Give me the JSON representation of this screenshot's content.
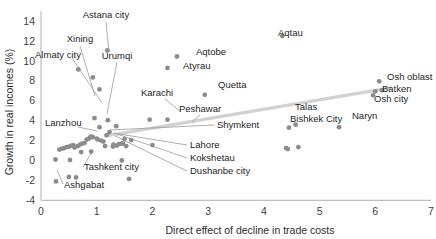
{
  "chart_data": {
    "type": "scatter",
    "title": "",
    "xlabel": "Direct effect of decline in trade costs",
    "ylabel": "Growth  in real incomes (%)",
    "xlim": [
      0,
      7
    ],
    "ylim": [
      -4,
      15
    ],
    "xticks": [
      "0",
      "1",
      "2",
      "3",
      "4",
      "5",
      "6",
      "7"
    ],
    "yticks": [
      "-4",
      "-2",
      "0",
      "2",
      "4",
      "6",
      "8",
      "10",
      "12",
      "14"
    ],
    "grid": false,
    "legend": "none",
    "trendline": {
      "x0": 1.15,
      "y0": 2.45,
      "x1": 6.27,
      "y1": 7.3
    },
    "labeled_points": [
      {
        "name": "Astana city",
        "x": 1.19,
        "y": 11.05
      },
      {
        "name": "Xining",
        "x": 0.67,
        "y": 9.15
      },
      {
        "name": "Almaty city",
        "x": 0.93,
        "y": 8.35
      },
      {
        "name": "Urumqi",
        "x": 1.05,
        "y": 7.15
      },
      {
        "name": "Aqtobe",
        "x": 2.44,
        "y": 10.45
      },
      {
        "name": "Atyrau",
        "x": 2.27,
        "y": 9.3
      },
      {
        "name": "Aqtau",
        "x": 4.33,
        "y": 12.5
      },
      {
        "name": "Quetta",
        "x": 2.94,
        "y": 6.6
      },
      {
        "name": "Karachi",
        "x": 1.95,
        "y": 4.1
      },
      {
        "name": "Peshawar",
        "x": 2.27,
        "y": 4.1
      },
      {
        "name": "Shymkent",
        "x": 1.18,
        "y": 2.55
      },
      {
        "name": "Lahore",
        "x": 1.47,
        "y": 1.7
      },
      {
        "name": "Kokshetau",
        "x": 1.36,
        "y": 1.5
      },
      {
        "name": "Dushanbe city",
        "x": 1.29,
        "y": 1.4
      },
      {
        "name": "Lanzhou",
        "x": 0.93,
        "y": 2.35
      },
      {
        "name": "Tashkent city",
        "x": 0.72,
        "y": 0.85
      },
      {
        "name": "Ashgabat",
        "x": 0.5,
        "y": -1.65
      },
      {
        "name": "Osh oblast",
        "x": 6.07,
        "y": 7.95
      },
      {
        "name": "Batken",
        "x": 6.12,
        "y": 7.05
      },
      {
        "name": "Osh city",
        "x": 5.96,
        "y": 6.55
      },
      {
        "name": "Talas",
        "x": 4.57,
        "y": 3.6
      },
      {
        "name": "Bishkek City",
        "x": 4.45,
        "y": 3.3
      },
      {
        "name": "Naryn",
        "x": 5.35,
        "y": 3.35
      }
    ],
    "unlabeled_points": [
      {
        "x": 0.26,
        "y": 0.1
      },
      {
        "x": 0.27,
        "y": -2.1
      },
      {
        "x": 0.33,
        "y": 1.1
      },
      {
        "x": 0.38,
        "y": 1.2
      },
      {
        "x": 0.42,
        "y": 1.25
      },
      {
        "x": 0.46,
        "y": 1.35
      },
      {
        "x": 0.5,
        "y": 1.4
      },
      {
        "x": 0.52,
        "y": 0.05
      },
      {
        "x": 0.55,
        "y": 1.5
      },
      {
        "x": 0.58,
        "y": 1.55
      },
      {
        "x": 0.6,
        "y": 1.3
      },
      {
        "x": 0.63,
        "y": -1.7
      },
      {
        "x": 0.66,
        "y": 1.45
      },
      {
        "x": 0.7,
        "y": 1.6
      },
      {
        "x": 0.74,
        "y": 1.7
      },
      {
        "x": 0.78,
        "y": 1.75
      },
      {
        "x": 0.82,
        "y": 2.1
      },
      {
        "x": 0.86,
        "y": 2.2
      },
      {
        "x": 0.88,
        "y": 2.3
      },
      {
        "x": 0.9,
        "y": 2.4
      },
      {
        "x": 0.96,
        "y": 4.25
      },
      {
        "x": 1.0,
        "y": 2.2
      },
      {
        "x": 1.02,
        "y": 2.1
      },
      {
        "x": 1.05,
        "y": 3.35
      },
      {
        "x": 1.08,
        "y": 2.0
      },
      {
        "x": 1.12,
        "y": 1.9
      },
      {
        "x": 1.15,
        "y": 1.45
      },
      {
        "x": 1.2,
        "y": 4.05
      },
      {
        "x": 1.23,
        "y": 2.85
      },
      {
        "x": 1.3,
        "y": 1.6
      },
      {
        "x": 1.35,
        "y": 3.45
      },
      {
        "x": 1.4,
        "y": 1.65
      },
      {
        "x": 1.45,
        "y": 1.7
      },
      {
        "x": 1.5,
        "y": 2.15
      },
      {
        "x": 1.53,
        "y": 1.45
      },
      {
        "x": 1.58,
        "y": -1.85
      },
      {
        "x": 1.62,
        "y": 2.05
      },
      {
        "x": 1.45,
        "y": 0.0
      },
      {
        "x": 0.9,
        "y": 0.9
      },
      {
        "x": 4.43,
        "y": 1.15
      },
      {
        "x": 4.62,
        "y": 1.35
      },
      {
        "x": 4.4,
        "y": 1.25
      },
      {
        "x": 6.0,
        "y": 6.95
      },
      {
        "x": 2.0,
        "y": 1.55
      }
    ]
  }
}
